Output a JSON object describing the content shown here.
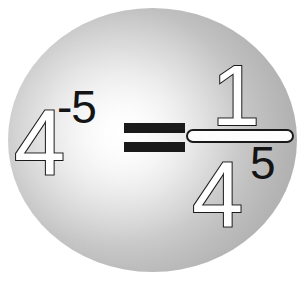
{
  "image": {
    "title": "Negative exponent rule illustration",
    "background_color": "#ffffff"
  },
  "sphere": {
    "name": "grey sphere",
    "highlight_color": "#ffffff",
    "mid_color": "#cbcbcb",
    "edge_color": "#a5a5a5"
  },
  "equation": {
    "text": "4^-5 = 1/4^5",
    "left_side": {
      "base": "4",
      "exponent": "-5"
    },
    "operator": "=",
    "right_side": {
      "numerator": "1",
      "denominator_base": "4",
      "denominator_exponent": "5"
    },
    "outline_color": "#1a1a1a",
    "fill_color": "#ffffff",
    "exponent_color": "#141414"
  }
}
